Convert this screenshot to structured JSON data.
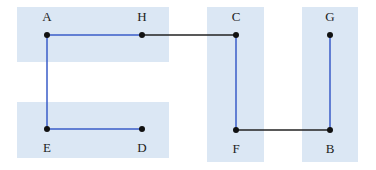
{
  "diagram": {
    "colors": {
      "region": "#dbe7f4",
      "tree_edge": "#3a5cc8",
      "bridge_edge": "#222222",
      "node": "#111111",
      "background": "#ffffff"
    },
    "regions": [
      {
        "id": "region-top-left",
        "x": 17,
        "y": 7,
        "w": 152,
        "h": 55
      },
      {
        "id": "region-bottom-left",
        "x": 17,
        "y": 102,
        "w": 152,
        "h": 56
      },
      {
        "id": "region-cf",
        "x": 207,
        "y": 7,
        "w": 57,
        "h": 155
      },
      {
        "id": "region-gb",
        "x": 302,
        "y": 7,
        "w": 56,
        "h": 155
      }
    ],
    "nodes": [
      {
        "id": "A",
        "label": "A",
        "x": 47,
        "y": 35,
        "label_pos": "above"
      },
      {
        "id": "H",
        "label": "H",
        "x": 142,
        "y": 35,
        "label_pos": "above"
      },
      {
        "id": "C",
        "label": "C",
        "x": 236,
        "y": 35,
        "label_pos": "above"
      },
      {
        "id": "G",
        "label": "G",
        "x": 330,
        "y": 35,
        "label_pos": "above"
      },
      {
        "id": "E",
        "label": "E",
        "x": 47,
        "y": 129,
        "label_pos": "below"
      },
      {
        "id": "D",
        "label": "D",
        "x": 142,
        "y": 129,
        "label_pos": "below"
      },
      {
        "id": "F",
        "label": "F",
        "x": 236,
        "y": 130,
        "label_pos": "below"
      },
      {
        "id": "B",
        "label": "B",
        "x": 330,
        "y": 130,
        "label_pos": "below"
      }
    ],
    "edges": [
      {
        "from": "A",
        "to": "H",
        "type": "tree"
      },
      {
        "from": "A",
        "to": "E",
        "type": "tree"
      },
      {
        "from": "E",
        "to": "D",
        "type": "tree"
      },
      {
        "from": "H",
        "to": "C",
        "type": "bridge"
      },
      {
        "from": "C",
        "to": "F",
        "type": "tree"
      },
      {
        "from": "F",
        "to": "B",
        "type": "bridge"
      },
      {
        "from": "G",
        "to": "B",
        "type": "tree"
      }
    ]
  }
}
